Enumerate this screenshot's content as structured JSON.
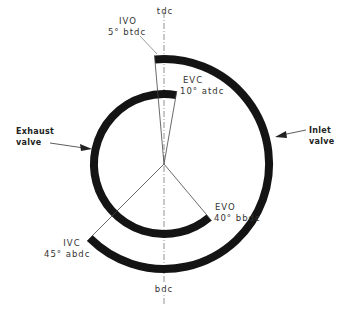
{
  "diagram": {
    "type": "valve-timing-diagram",
    "center": {
      "x": 164,
      "y": 164
    },
    "colors": {
      "ring": "#141414",
      "line": "#444444",
      "axis": "#777777",
      "text": "#333333"
    },
    "axis": {
      "top_label": "tdc",
      "bottom_label": "bdc"
    },
    "inlet": {
      "label_line1": "Inlet",
      "label_line2": "valve",
      "radius": 105,
      "opens": {
        "event": "IVO",
        "angle_label": "5° btdc",
        "angle_deg": -5
      },
      "closes": {
        "event": "IVC",
        "angle_label": "45° abdc",
        "angle_deg": 225
      }
    },
    "exhaust": {
      "label_line1": "Exhaust",
      "label_line2": "valve",
      "radius": 70,
      "opens": {
        "event": "EVO",
        "angle_label": "40° bbdc",
        "angle_deg": 140
      },
      "closes": {
        "event": "EVC",
        "angle_label": "10° atdc",
        "angle_deg": 370
      }
    }
  }
}
